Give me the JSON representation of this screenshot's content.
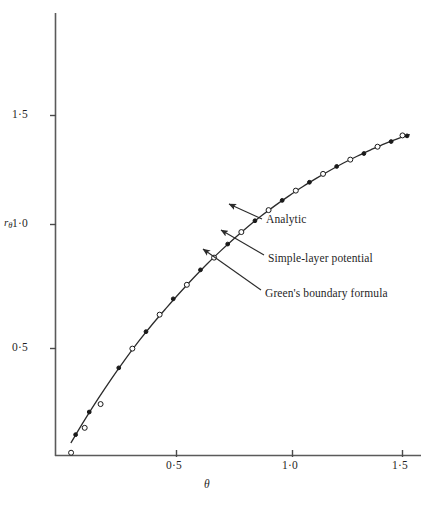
{
  "chart_data": {
    "type": "line",
    "title": "",
    "xlabel": "θ",
    "ylabel": "rθ",
    "xlim": [
      0.0,
      1.6
    ],
    "ylim": [
      0.0,
      1.7
    ],
    "grid": false,
    "legend_position": "inline-annotations",
    "x_ticks": [
      0.5,
      1.0,
      1.5
    ],
    "x_tick_labels": [
      "0·5",
      "1·0",
      "1·5"
    ],
    "y_ticks": [
      0.5,
      1.0,
      1.5
    ],
    "y_tick_labels": [
      "0·5",
      "1·0",
      "1·5"
    ],
    "series": [
      {
        "name": "Analytic",
        "marker": "line",
        "x": [
          0.04,
          0.1,
          0.16,
          0.22,
          0.28,
          0.34,
          0.4,
          0.46,
          0.52,
          0.58,
          0.64,
          0.7,
          0.76,
          0.82,
          0.88,
          0.94,
          1.0,
          1.06,
          1.12,
          1.18,
          1.24,
          1.3,
          1.36,
          1.42,
          1.48,
          1.53
        ],
        "y": [
          0.055,
          0.155,
          0.25,
          0.34,
          0.425,
          0.505,
          0.58,
          0.65,
          0.718,
          0.783,
          0.845,
          0.903,
          0.958,
          1.01,
          1.058,
          1.103,
          1.145,
          1.185,
          1.222,
          1.257,
          1.29,
          1.32,
          1.348,
          1.375,
          1.398,
          1.415
        ]
      },
      {
        "name": "Simple-layer potential",
        "marker": "filled-circle",
        "x": [
          0.06,
          0.12,
          0.25,
          0.37,
          0.49,
          0.61,
          0.73,
          0.85,
          0.97,
          1.09,
          1.21,
          1.33,
          1.45,
          1.52
        ],
        "y": [
          0.09,
          0.19,
          0.385,
          0.545,
          0.69,
          0.818,
          0.932,
          1.035,
          1.125,
          1.205,
          1.275,
          1.332,
          1.385,
          1.41
        ]
      },
      {
        "name": "Green's boundary formula",
        "marker": "open-circle",
        "x": [
          0.04,
          0.1,
          0.17,
          0.31,
          0.43,
          0.55,
          0.67,
          0.79,
          0.91,
          1.03,
          1.15,
          1.27,
          1.39,
          1.5
        ],
        "y": [
          0.01,
          0.12,
          0.225,
          0.47,
          0.62,
          0.752,
          0.872,
          0.985,
          1.082,
          1.168,
          1.242,
          1.305,
          1.362,
          1.412
        ]
      }
    ],
    "annotations": [
      {
        "id": "analytic",
        "text": "Analytic",
        "label_x": 266,
        "label_y": 220,
        "arrow_from_x": 262,
        "arrow_from_y": 219,
        "arrow_to_x": 229,
        "arrow_to_y": 204
      },
      {
        "id": "simple-layer-potential",
        "text": "Simple-layer potential",
        "label_x": 268,
        "label_y": 259,
        "arrow_from_x": 264,
        "arrow_from_y": 255,
        "arrow_to_x": 221,
        "arrow_to_y": 230
      },
      {
        "id": "greens-boundary-formula",
        "text": "Green's boundary formula",
        "label_x": 265,
        "label_y": 294,
        "arrow_from_x": 261,
        "arrow_from_y": 290,
        "arrow_to_x": 203,
        "arrow_to_y": 249
      }
    ],
    "colors": {
      "axis": "#4a4a4a",
      "curve": "#2b2b2b",
      "marker_fill": "#1a1a1a",
      "marker_open": "#ffffff",
      "text": "#1f1f1f",
      "background": "#ffffff"
    }
  }
}
